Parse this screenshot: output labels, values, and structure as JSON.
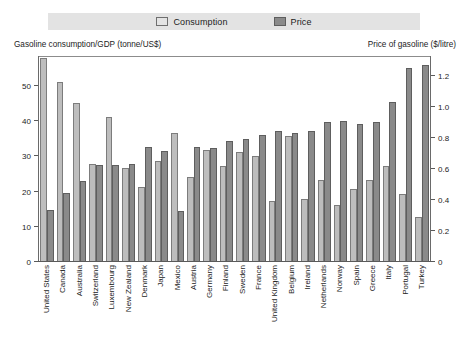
{
  "legend": {
    "items": [
      {
        "label": "Consumption",
        "swatch": "#bdbdbd",
        "name": "consumption"
      },
      {
        "label": "Price",
        "swatch": "#8a8a8a",
        "name": "price"
      }
    ]
  },
  "axes": {
    "left_caption": "Gasoline consumption/GDP (tonne/US$)",
    "right_caption": "Price of gasoline ($/litre)",
    "left_ticks": [
      "0",
      "10",
      "20",
      "30",
      "40",
      "50"
    ],
    "right_ticks": [
      "0",
      "0.2",
      "0.4",
      "0.6",
      "0.8",
      "1.0",
      "1.2"
    ]
  },
  "colors": {
    "consumption": "#bdbdbd",
    "price": "#8a8a8a",
    "legend_band": "#e3e3e3",
    "axis": "#5a5a5a"
  },
  "chart_data": {
    "type": "bar",
    "title": "",
    "xlabel": "",
    "ylabel": "Gasoline consumption/GDP (tonne/US$)",
    "y2label": "Price of gasoline ($/litre)",
    "ylim": [
      0,
      58.5
    ],
    "y2lim": [
      0,
      1.33
    ],
    "grid": false,
    "legend_position": "top-center",
    "categories": [
      "United States",
      "Canada",
      "Australia",
      "Switzerland",
      "Luxembourg",
      "New Zealand",
      "Denmark",
      "Japan",
      "Mexico",
      "Austria",
      "Germany",
      "Finland",
      "Sweden",
      "France",
      "United Kingdom",
      "Belgium",
      "Ireland",
      "Netherlands",
      "Norway",
      "Spain",
      "Greece",
      "Italy",
      "Portugal",
      "Turkey"
    ],
    "series": [
      {
        "name": "Consumption",
        "axis": "left",
        "units": "tonne/US$",
        "values": [
          58,
          51,
          45,
          27.5,
          41,
          26.5,
          21,
          28.5,
          36.5,
          24,
          31.5,
          27,
          31,
          30,
          17,
          35.5,
          17.5,
          23,
          16,
          20.5,
          23,
          27,
          19,
          12.5
        ]
      },
      {
        "name": "Price",
        "axis": "right",
        "units": "$/litre",
        "values": [
          0.33,
          0.44,
          0.52,
          0.62,
          0.62,
          0.63,
          0.74,
          0.71,
          0.32,
          0.74,
          0.73,
          0.78,
          0.79,
          0.82,
          0.84,
          0.83,
          0.84,
          0.9,
          0.91,
          0.89,
          0.9,
          1.03,
          1.25,
          1.27
        ]
      }
    ]
  }
}
